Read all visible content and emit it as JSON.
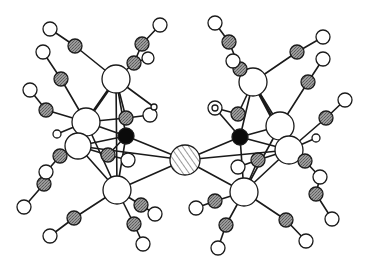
{
  "figure": {
    "colors": {
      "background": "#ffffff",
      "bond": "#1a1a1a",
      "metal_atom": "#ffffff",
      "carbon_atom": "#8a8a8a",
      "oxygen_atom": "#ffffff",
      "interstitial_atom": "#0a0a0a",
      "bridging_atom": "#d8d8d8"
    },
    "legend": [],
    "atom_types": {
      "M": "large open circle (metal)",
      "C": "medium grey stippled circle (carbonyl carbon)",
      "O": "small open circle (carbonyl oxygen)",
      "X": "solid black circle (interstitial atom)",
      "Z": "hatched circle (bridging central atom)",
      "H": "very small open circle (hydride)"
    },
    "atoms": [
      {
        "id": "Z1",
        "type": "Z",
        "x": 185,
        "y": 160,
        "r": 15
      },
      {
        "id": "XL",
        "type": "X",
        "x": 126,
        "y": 136,
        "r": 8
      },
      {
        "id": "ML1",
        "type": "M",
        "x": 116,
        "y": 79,
        "r": 14
      },
      {
        "id": "ML2",
        "type": "M",
        "x": 86,
        "y": 122,
        "r": 14
      },
      {
        "id": "ML3",
        "type": "M",
        "x": 78,
        "y": 146,
        "r": 13
      },
      {
        "id": "ML4",
        "type": "M",
        "x": 117,
        "y": 190,
        "r": 14
      },
      {
        "id": "XR",
        "type": "X",
        "x": 240,
        "y": 137,
        "r": 8
      },
      {
        "id": "MR1",
        "type": "M",
        "x": 253,
        "y": 82,
        "r": 14
      },
      {
        "id": "MR2",
        "type": "M",
        "x": 280,
        "y": 126,
        "r": 14
      },
      {
        "id": "MR3",
        "type": "M",
        "x": 289,
        "y": 150,
        "r": 14
      },
      {
        "id": "MR4",
        "type": "M",
        "x": 244,
        "y": 192,
        "r": 14
      },
      {
        "id": "CL1",
        "type": "C",
        "x": 75,
        "y": 46,
        "r": 7
      },
      {
        "id": "OL1",
        "type": "O",
        "x": 50,
        "y": 29,
        "r": 7
      },
      {
        "id": "CL2",
        "type": "C",
        "x": 61,
        "y": 79,
        "r": 7
      },
      {
        "id": "OL2",
        "type": "O",
        "x": 43,
        "y": 52,
        "r": 7
      },
      {
        "id": "CL3",
        "type": "C",
        "x": 46,
        "y": 110,
        "r": 7
      },
      {
        "id": "OL3",
        "type": "O",
        "x": 30,
        "y": 90,
        "r": 7
      },
      {
        "id": "CL4",
        "type": "C",
        "x": 142,
        "y": 44,
        "r": 7
      },
      {
        "id": "OL4",
        "type": "O",
        "x": 160,
        "y": 25,
        "r": 7
      },
      {
        "id": "CL5",
        "type": "C",
        "x": 134,
        "y": 63,
        "r": 7
      },
      {
        "id": "OL5",
        "type": "O",
        "x": 148,
        "y": 58,
        "r": 6
      },
      {
        "id": "CL6",
        "type": "C",
        "x": 126,
        "y": 118,
        "r": 7
      },
      {
        "id": "OL6",
        "type": "O",
        "x": 150,
        "y": 115,
        "r": 7
      },
      {
        "id": "HL1",
        "type": "H",
        "x": 154,
        "y": 107,
        "r": 3
      },
      {
        "id": "HL2",
        "type": "H",
        "x": 57,
        "y": 134,
        "r": 4
      },
      {
        "id": "CL7",
        "type": "C",
        "x": 60,
        "y": 156,
        "r": 7
      },
      {
        "id": "OL7",
        "type": "O",
        "x": 46,
        "y": 172,
        "r": 7
      },
      {
        "id": "CL8",
        "type": "C",
        "x": 44,
        "y": 184,
        "r": 7
      },
      {
        "id": "OL8",
        "type": "O",
        "x": 24,
        "y": 207,
        "r": 7
      },
      {
        "id": "CL9",
        "type": "C",
        "x": 108,
        "y": 155,
        "r": 7
      },
      {
        "id": "OL9",
        "type": "O",
        "x": 128,
        "y": 160,
        "r": 7
      },
      {
        "id": "CL10",
        "type": "C",
        "x": 74,
        "y": 218,
        "r": 7
      },
      {
        "id": "OL10",
        "type": "O",
        "x": 50,
        "y": 236,
        "r": 7
      },
      {
        "id": "CL11",
        "type": "C",
        "x": 141,
        "y": 205,
        "r": 7
      },
      {
        "id": "OL11",
        "type": "O",
        "x": 155,
        "y": 214,
        "r": 7
      },
      {
        "id": "CL12",
        "type": "C",
        "x": 134,
        "y": 224,
        "r": 7
      },
      {
        "id": "OL12",
        "type": "O",
        "x": 143,
        "y": 244,
        "r": 7
      },
      {
        "id": "CR1",
        "type": "C",
        "x": 229,
        "y": 42,
        "r": 7
      },
      {
        "id": "OR1",
        "type": "O",
        "x": 215,
        "y": 23,
        "r": 7
      },
      {
        "id": "CR2",
        "type": "C",
        "x": 240,
        "y": 69,
        "r": 7
      },
      {
        "id": "OR2",
        "type": "O",
        "x": 233,
        "y": 61,
        "r": 7
      },
      {
        "id": "CR3",
        "type": "C",
        "x": 297,
        "y": 52,
        "r": 7
      },
      {
        "id": "OR3",
        "type": "O",
        "x": 323,
        "y": 37,
        "r": 7
      },
      {
        "id": "CR4",
        "type": "C",
        "x": 308,
        "y": 82,
        "r": 7
      },
      {
        "id": "OR4",
        "type": "O",
        "x": 323,
        "y": 59,
        "r": 7
      },
      {
        "id": "CR5",
        "type": "C",
        "x": 326,
        "y": 118,
        "r": 7
      },
      {
        "id": "OR5",
        "type": "O",
        "x": 345,
        "y": 100,
        "r": 7
      },
      {
        "id": "CR6",
        "type": "C",
        "x": 238,
        "y": 114,
        "r": 7
      },
      {
        "id": "OR6",
        "type": "O",
        "x": 215,
        "y": 108,
        "r": 7
      },
      {
        "id": "HR1",
        "type": "H",
        "x": 215,
        "y": 108,
        "r": 3
      },
      {
        "id": "HR2",
        "type": "H",
        "x": 316,
        "y": 138,
        "r": 4
      },
      {
        "id": "CR7",
        "type": "C",
        "x": 305,
        "y": 161,
        "r": 7
      },
      {
        "id": "OR7",
        "type": "O",
        "x": 320,
        "y": 177,
        "r": 7
      },
      {
        "id": "CR8",
        "type": "C",
        "x": 316,
        "y": 194,
        "r": 7
      },
      {
        "id": "OR8",
        "type": "O",
        "x": 332,
        "y": 219,
        "r": 7
      },
      {
        "id": "CR9",
        "type": "C",
        "x": 258,
        "y": 160,
        "r": 7
      },
      {
        "id": "OR9",
        "type": "O",
        "x": 238,
        "y": 167,
        "r": 7
      },
      {
        "id": "CR10",
        "type": "C",
        "x": 215,
        "y": 201,
        "r": 7
      },
      {
        "id": "OR10",
        "type": "O",
        "x": 196,
        "y": 208,
        "r": 7
      },
      {
        "id": "CR11",
        "type": "C",
        "x": 226,
        "y": 225,
        "r": 7
      },
      {
        "id": "OR11",
        "type": "O",
        "x": 218,
        "y": 248,
        "r": 7
      },
      {
        "id": "CR12",
        "type": "C",
        "x": 286,
        "y": 220,
        "r": 7
      },
      {
        "id": "OR12",
        "type": "O",
        "x": 306,
        "y": 241,
        "r": 7
      }
    ],
    "bonds": [
      [
        "Z1",
        "XL"
      ],
      [
        "Z1",
        "XR"
      ],
      [
        "Z1",
        "ML4"
      ],
      [
        "Z1",
        "MR4"
      ],
      [
        "Z1",
        "ML3"
      ],
      [
        "Z1",
        "MR3"
      ],
      [
        "ML1",
        "ML2"
      ],
      [
        "ML1",
        "XL"
      ],
      [
        "ML1",
        "CL6"
      ],
      [
        "ML1",
        "HL1"
      ],
      [
        "ML2",
        "XL"
      ],
      [
        "ML2",
        "ML3"
      ],
      [
        "ML2",
        "CL6"
      ],
      [
        "ML3",
        "XL"
      ],
      [
        "ML3",
        "ML4"
      ],
      [
        "ML4",
        "XL"
      ],
      [
        "ML2",
        "ML4"
      ],
      [
        "ML1",
        "ML4"
      ],
      [
        "ML1",
        "CL1"
      ],
      [
        "CL1",
        "OL1"
      ],
      [
        "ML2",
        "CL2"
      ],
      [
        "CL2",
        "OL2"
      ],
      [
        "ML2",
        "CL3"
      ],
      [
        "CL3",
        "OL3"
      ],
      [
        "ML1",
        "CL5"
      ],
      [
        "CL5",
        "CL4"
      ],
      [
        "CL4",
        "OL4"
      ],
      [
        "CL5",
        "OL5"
      ],
      [
        "CL6",
        "OL6"
      ],
      [
        "ML2",
        "HL2"
      ],
      [
        "ML3",
        "CL7"
      ],
      [
        "CL7",
        "OL7"
      ],
      [
        "OL7",
        "CL8"
      ],
      [
        "CL8",
        "OL8"
      ],
      [
        "ML3",
        "CL9"
      ],
      [
        "CL9",
        "OL9"
      ],
      [
        "XL",
        "CL9"
      ],
      [
        "ML4",
        "CL10"
      ],
      [
        "CL10",
        "OL10"
      ],
      [
        "ML4",
        "CL11"
      ],
      [
        "CL11",
        "OL11"
      ],
      [
        "ML4",
        "CL12"
      ],
      [
        "CL12",
        "OL12"
      ],
      [
        "MR1",
        "MR2"
      ],
      [
        "MR1",
        "XR"
      ],
      [
        "MR1",
        "CR6"
      ],
      [
        "MR2",
        "XR"
      ],
      [
        "MR2",
        "MR3"
      ],
      [
        "MR3",
        "XR"
      ],
      [
        "MR3",
        "MR4"
      ],
      [
        "MR4",
        "XR"
      ],
      [
        "MR2",
        "MR4"
      ],
      [
        "MR1",
        "MR3"
      ],
      [
        "MR1",
        "CR2"
      ],
      [
        "CR2",
        "CR1"
      ],
      [
        "CR1",
        "OR1"
      ],
      [
        "CR2",
        "OR2"
      ],
      [
        "MR1",
        "CR3"
      ],
      [
        "CR3",
        "OR3"
      ],
      [
        "MR2",
        "CR4"
      ],
      [
        "CR4",
        "OR4"
      ],
      [
        "MR3",
        "CR5"
      ],
      [
        "CR5",
        "OR5"
      ],
      [
        "CR6",
        "OR6"
      ],
      [
        "XR",
        "HR1"
      ],
      [
        "MR3",
        "HR2"
      ],
      [
        "MR3",
        "CR7"
      ],
      [
        "CR7",
        "OR7"
      ],
      [
        "OR7",
        "CR8"
      ],
      [
        "CR8",
        "OR8"
      ],
      [
        "MR4",
        "CR9"
      ],
      [
        "CR9",
        "OR9"
      ],
      [
        "MR3",
        "CR9"
      ],
      [
        "MR4",
        "CR10"
      ],
      [
        "CR10",
        "OR10"
      ],
      [
        "MR4",
        "CR11"
      ],
      [
        "CR11",
        "OR11"
      ],
      [
        "MR4",
        "CR12"
      ],
      [
        "CR12",
        "OR12"
      ]
    ],
    "wedge_bonds": [
      [
        "ML1",
        "ML2"
      ],
      [
        "MR1",
        "MR3"
      ]
    ]
  }
}
